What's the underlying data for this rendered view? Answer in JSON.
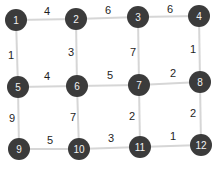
{
  "graph": {
    "nodes": [
      {
        "id": "1",
        "label": "1",
        "x": 16,
        "y": 20
      },
      {
        "id": "2",
        "label": "2",
        "x": 76,
        "y": 19
      },
      {
        "id": "3",
        "label": "3",
        "x": 138,
        "y": 17
      },
      {
        "id": "4",
        "label": "4",
        "x": 199,
        "y": 16
      },
      {
        "id": "5",
        "label": "5",
        "x": 18,
        "y": 87
      },
      {
        "id": "6",
        "label": "6",
        "x": 77,
        "y": 86
      },
      {
        "id": "7",
        "label": "7",
        "x": 139,
        "y": 85
      },
      {
        "id": "8",
        "label": "8",
        "x": 200,
        "y": 82
      },
      {
        "id": "9",
        "label": "9",
        "x": 19,
        "y": 149
      },
      {
        "id": "10",
        "label": "10",
        "x": 79,
        "y": 149
      },
      {
        "id": "11",
        "label": "11",
        "x": 140,
        "y": 147
      },
      {
        "id": "12",
        "label": "12",
        "x": 201,
        "y": 145
      }
    ],
    "edges": [
      {
        "from": "1",
        "to": "2",
        "weight": "4",
        "lx": 47,
        "ly": 11
      },
      {
        "from": "2",
        "to": "3",
        "weight": "6",
        "lx": 108,
        "ly": 10
      },
      {
        "from": "3",
        "to": "4",
        "weight": "6",
        "lx": 170,
        "ly": 9
      },
      {
        "from": "1",
        "to": "5",
        "weight": "1",
        "lx": 11,
        "ly": 55
      },
      {
        "from": "2",
        "to": "6",
        "weight": "3",
        "lx": 71,
        "ly": 52
      },
      {
        "from": "3",
        "to": "7",
        "weight": "7",
        "lx": 133,
        "ly": 52
      },
      {
        "from": "4",
        "to": "8",
        "weight": "1",
        "lx": 193,
        "ly": 49
      },
      {
        "from": "5",
        "to": "6",
        "weight": "4",
        "lx": 47,
        "ly": 76
      },
      {
        "from": "6",
        "to": "7",
        "weight": "5",
        "lx": 110,
        "ly": 75
      },
      {
        "from": "7",
        "to": "8",
        "weight": "2",
        "lx": 173,
        "ly": 73
      },
      {
        "from": "5",
        "to": "9",
        "weight": "9",
        "lx": 12,
        "ly": 118
      },
      {
        "from": "6",
        "to": "10",
        "weight": "7",
        "lx": 73,
        "ly": 117
      },
      {
        "from": "7",
        "to": "11",
        "weight": "2",
        "lx": 132,
        "ly": 116
      },
      {
        "from": "8",
        "to": "12",
        "weight": "2",
        "lx": 193,
        "ly": 113
      },
      {
        "from": "9",
        "to": "10",
        "weight": "5",
        "lx": 50,
        "ly": 140
      },
      {
        "from": "10",
        "to": "11",
        "weight": "3",
        "lx": 111,
        "ly": 138
      },
      {
        "from": "11",
        "to": "12",
        "weight": "1",
        "lx": 173,
        "ly": 136
      }
    ],
    "colors": {
      "node_fill": "#3b3b3b",
      "node_text": "#f2f2f2",
      "edge": "#d6d6d6",
      "weight_text": "#1e1e1e"
    },
    "node_radius": 11
  }
}
